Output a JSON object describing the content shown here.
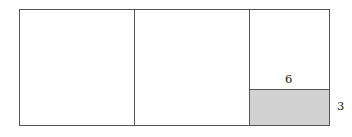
{
  "figure": {
    "kind": "partitioned-rectangle-diagram",
    "stroke_color": "#555555",
    "background_color": "#ffffff",
    "shaded_fill_color": "#d2d2d2",
    "label_color": "#1b1b1b",
    "outer_rectangle": {
      "name": "outer-rectangle",
      "x": 19,
      "y": 9,
      "width": 311,
      "height": 117
    },
    "vertical_dividers": [
      {
        "name": "divider-v-1",
        "x": 134
      },
      {
        "name": "divider-v-2",
        "x": 249
      }
    ],
    "horizontal_divider": {
      "name": "divider-h-1",
      "x": 249,
      "y": 89,
      "width": 81
    },
    "shaded_rectangle": {
      "name": "shaded-rectangle",
      "x": 249,
      "y": 89,
      "width": 81,
      "height": 37
    },
    "labels": {
      "width_label": "6",
      "height_label": "3"
    }
  }
}
